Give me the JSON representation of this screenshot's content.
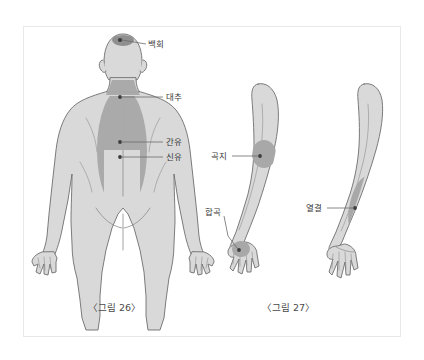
{
  "page": {
    "background_color": "#ffffff",
    "frame_border_color": "#e8e8e8"
  },
  "palette": {
    "body_fill": "#d9d9d9",
    "body_outline": "#6e6e6e",
    "highlight_fill": "#a8a8a8",
    "point_dot": "#4a4a4a",
    "leader_line": "#6b6b6b",
    "label_text": "#3a3a3a",
    "caption_text": "#4a4a4a"
  },
  "figures": [
    {
      "id": "figure-26",
      "caption": "〈그림 26〉",
      "view": "back-of-body",
      "labels": [
        {
          "id": "baekhoe",
          "text": "백회",
          "point": "crown of head"
        },
        {
          "id": "daechu",
          "text": "대추",
          "point": "base of neck"
        },
        {
          "id": "ganyu",
          "text": "간유",
          "point": "mid back"
        },
        {
          "id": "sinyu",
          "text": "신유",
          "point": "lower back"
        }
      ]
    },
    {
      "id": "figure-27",
      "caption": "〈그림 27〉",
      "view": "arms",
      "labels": [
        {
          "id": "gokji",
          "text": "곡지",
          "point": "outer elbow crease"
        },
        {
          "id": "hapgok",
          "text": "합곡",
          "point": "back of hand, thumb web"
        },
        {
          "id": "yeolgyeol",
          "text": "열결",
          "point": "inner forearm above wrist"
        }
      ]
    }
  ],
  "label_text": {
    "baekhoe": "백회",
    "daechu": "대추",
    "ganyu": "간유",
    "sinyu": "신유",
    "gokji": "곡지",
    "hapgok": "합곡",
    "yeolgyeol": "열결"
  },
  "caption_text": {
    "figure26": "〈그림 26〉",
    "figure27": "〈그림 27〉"
  }
}
